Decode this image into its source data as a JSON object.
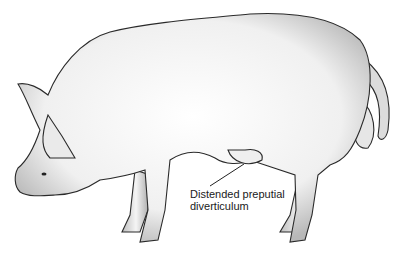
{
  "figure": {
    "annotation": {
      "line1": "Distended preputial",
      "line2": "diverticulum"
    },
    "colors": {
      "outline": "#2a2a2a",
      "shade": "#9a9a9a",
      "body": "#f4f4f4"
    }
  }
}
